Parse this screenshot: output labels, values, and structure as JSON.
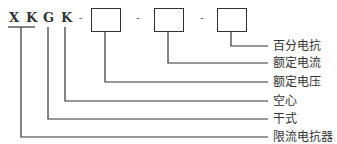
{
  "model_code": {
    "letters": [
      "X",
      "K",
      "G",
      "K"
    ],
    "separators": [
      "-",
      "-",
      "-"
    ],
    "boxes": 3
  },
  "labels": [
    "百分电抗",
    "额定电流",
    "额定电压",
    "空心",
    "干式",
    "限流电抗器"
  ],
  "colors": {
    "line": "#333333",
    "background": "#ffffff"
  }
}
